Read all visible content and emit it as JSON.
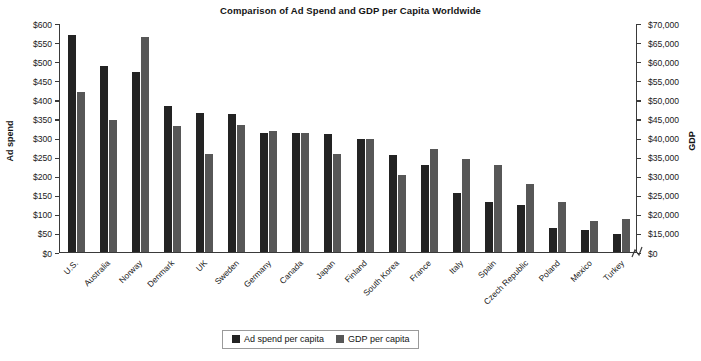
{
  "chart_data": {
    "type": "bar",
    "title": "Comparison of Ad Spend and GDP per Capita Worldwide",
    "xlabel": "",
    "ylabel": "Ad spend",
    "y2label": "GDP",
    "grid": false,
    "legend_position": "bottom",
    "categories": [
      "U.S.",
      "Australia",
      "Norway",
      "Denmark",
      "UK",
      "Sweden",
      "Germany",
      "Canada",
      "Japan",
      "Finland",
      "South Korea",
      "France",
      "Italy",
      "Spain",
      "Czech Republic",
      "Poland",
      "Mexico",
      "Turkey"
    ],
    "series": [
      {
        "name": "Ad spend per capita",
        "axis": "left",
        "color": "#232323",
        "values": [
          568,
          488,
          472,
          382,
          363,
          362,
          312,
          311,
          310,
          297,
          255,
          228,
          155,
          130,
          123,
          62,
          57,
          46
        ]
      },
      {
        "name": "GDP per capita",
        "axis": "right",
        "color": "#575757",
        "values_left_scale": [
          418,
          345,
          563,
          330,
          258,
          332,
          318,
          312,
          258,
          296,
          202,
          270,
          243,
          228,
          178,
          130,
          82,
          87
        ],
        "values": [
          63900,
          52700,
          86000,
          50400,
          39400,
          50700,
          48600,
          47700,
          39400,
          45200,
          30900,
          41200,
          37100,
          34800,
          27200,
          19900,
          12500,
          13300
        ]
      }
    ],
    "y_left_ticks": [
      "$600",
      "$550",
      "$500",
      "$450",
      "$400",
      "$350",
      "$300",
      "$250",
      "$200",
      "$150",
      "$100",
      "$50",
      "$0"
    ],
    "y_left_lim": [
      0,
      600
    ],
    "y_right_ticks": [
      "$70,000",
      "$65,000",
      "$60,000",
      "$55,000",
      "$50,000",
      "$45,000",
      "$40,000",
      "$35,000",
      "$30,000",
      "$25,000",
      "$20,000",
      "$15,000",
      "$0"
    ],
    "y_right_lim": [
      0,
      70000
    ],
    "axis_break_right": true
  },
  "legend": {
    "items": [
      {
        "label": "Ad spend per capita",
        "swatch": "dark-swatch"
      },
      {
        "label": "GDP per capita",
        "swatch": "gray-swatch"
      }
    ]
  }
}
